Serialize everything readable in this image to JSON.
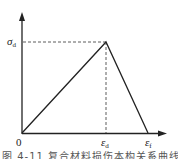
{
  "diagram": {
    "type": "stress-strain bilinear (triangular) damage curve",
    "axes": {
      "origin_label": "0",
      "y_axis_arrow": true,
      "x_axis_arrow": true
    },
    "labels": {
      "sigma": "σ",
      "sigma_sub": "d",
      "eps_d": "ε",
      "eps_d_sub": "d",
      "eps_f": "ε",
      "eps_f_sub": "f"
    },
    "points": [
      {
        "name": "origin",
        "x": 0,
        "y": 0
      },
      {
        "name": "peak",
        "x": "ε_d",
        "y": "σ_d"
      },
      {
        "name": "failure",
        "x": "ε_f",
        "y": 0
      }
    ],
    "caption": "图 4-11 复合材料损伤本构关系曲线"
  }
}
